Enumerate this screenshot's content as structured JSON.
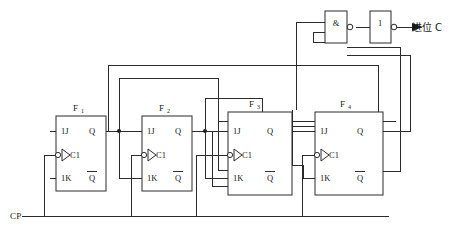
{
  "diagram": {
    "colors": {
      "line": "#2b2b2b",
      "text": "#1a1a1a",
      "background": "#ffffff"
    },
    "flipflops": [
      {
        "id": "ff1",
        "name": "F",
        "sub": "1",
        "pins": {
          "j": "1J",
          "clk": "C1",
          "k": "1K",
          "q": "Q",
          "qbar": "Q"
        }
      },
      {
        "id": "ff2",
        "name": "F",
        "sub": "2",
        "pins": {
          "j": "1J",
          "clk": "C1",
          "k": "1K",
          "q": "Q",
          "qbar": "Q"
        }
      },
      {
        "id": "ff3",
        "name": "F",
        "sub": "3",
        "pins": {
          "j": "1J",
          "clk": "C1",
          "k": "1K",
          "q": "Q",
          "qbar": "Q"
        }
      },
      {
        "id": "ff4",
        "name": "F",
        "sub": "4",
        "pins": {
          "j": "1J",
          "clk": "C1",
          "k": "1K",
          "q": "Q",
          "qbar": "Q"
        }
      }
    ],
    "gates": [
      {
        "id": "and-gate",
        "symbol": "&",
        "type": "and-nand"
      },
      {
        "id": "buffer-gate",
        "symbol": "1",
        "type": "inverter"
      }
    ],
    "signals": {
      "clock_label": "CP",
      "carry_label": "进位 C"
    }
  }
}
